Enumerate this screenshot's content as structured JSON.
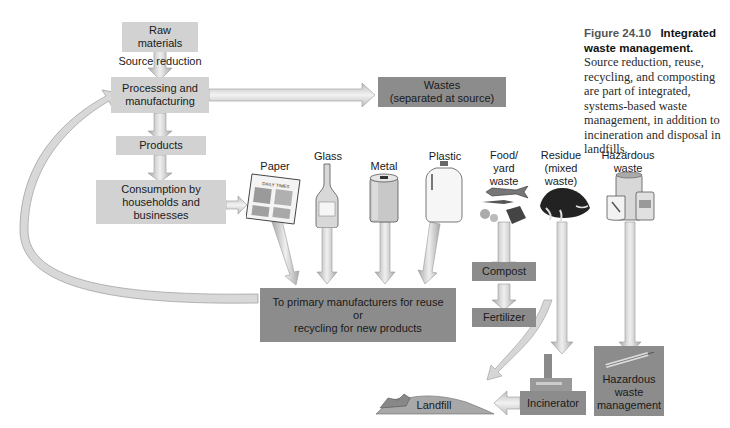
{
  "caption": {
    "figure_number": "Figure 24.10",
    "title": "Integrated waste management.",
    "body": "Source reduction, reuse, recycling, and composting are part of integrated, systems-based waste management, in addition to incineration and disposal in landfills."
  },
  "flow": {
    "raw_materials": "Raw\nmaterials",
    "source_reduction": "Source reduction",
    "processing": "Processing and\nmanufacturing",
    "products": "Products",
    "consumption": "Consumption by\nhouseholds and\nbusinesses",
    "wastes": "Wastes\n(separated at source)",
    "reuse_recycling": "To primary manufacturers for reuse\nor\nrecycling for new products",
    "compost": "Compost",
    "fertilizer": "Fertilizer",
    "incinerator": "Incinerator",
    "landfill": "Landfill",
    "hazardous_management": "Hazardous\nwaste\nmanagement"
  },
  "waste_types": [
    {
      "label": "Paper",
      "icon": "newspaper-icon",
      "newspaper_text": "DAILY TIMES"
    },
    {
      "label": "Glass",
      "icon": "bottle-icon"
    },
    {
      "label": "Metal",
      "icon": "can-icon"
    },
    {
      "label": "Plastic",
      "icon": "jug-icon"
    },
    {
      "label": "Food/\nyard\nwaste",
      "icon": "food-waste-icon"
    },
    {
      "label": "Residue\n(mixed\nwaste)",
      "icon": "mixed-waste-icon"
    },
    {
      "label": "Hazardous\nwaste",
      "icon": "hazardous-containers-icon"
    }
  ]
}
